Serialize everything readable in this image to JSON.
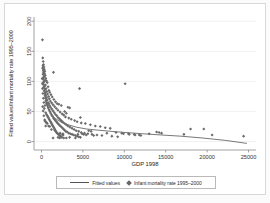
{
  "chart_data": {
    "type": "scatter",
    "title": "",
    "xlabel": "GDP 1998",
    "ylabel": "Fitted values/Infant mortality rate 1995–2000",
    "xlim": [
      -900,
      25900
    ],
    "ylim": [
      -14,
      207
    ],
    "xticks": [
      0,
      5000,
      10000,
      15000,
      20000,
      25000
    ],
    "xticklabels": [
      "0",
      "5000",
      "10000",
      "15000",
      "20000",
      "25000"
    ],
    "yticks": [
      0,
      50,
      100,
      150,
      200
    ],
    "yticklabels": [
      "0",
      "50",
      "100",
      "150",
      "200"
    ],
    "grid": true,
    "grid_axis": "y",
    "legend_position": "bottom-outside",
    "marker": "diamond",
    "marker_color": "#6b6b6b",
    "line_color": "#555555",
    "background_color": "#ffffff",
    "series": [
      {
        "name": "Infant mortality rate 1995–2000",
        "type": "scatter",
        "points": [
          [
            120,
            169
          ],
          [
            160,
            139
          ],
          [
            210,
            133
          ],
          [
            250,
            128
          ],
          [
            180,
            126
          ],
          [
            300,
            124
          ],
          [
            140,
            122
          ],
          [
            330,
            120
          ],
          [
            220,
            118
          ],
          [
            400,
            117
          ],
          [
            270,
            115
          ],
          [
            1450,
            115
          ],
          [
            370,
            113
          ],
          [
            190,
            112
          ],
          [
            460,
            110
          ],
          [
            310,
            108
          ],
          [
            240,
            106
          ],
          [
            520,
            105
          ],
          [
            150,
            104
          ],
          [
            420,
            102
          ],
          [
            600,
            101
          ],
          [
            340,
            100
          ],
          [
            280,
            99
          ],
          [
            700,
            98
          ],
          [
            10100,
            96
          ],
          [
            200,
            95
          ],
          [
            480,
            94
          ],
          [
            360,
            92
          ],
          [
            800,
            91
          ],
          [
            4600,
            88
          ],
          [
            260,
            90
          ],
          [
            560,
            88
          ],
          [
            420,
            86
          ],
          [
            900,
            85
          ],
          [
            320,
            84
          ],
          [
            640,
            83
          ],
          [
            1000,
            82
          ],
          [
            480,
            81
          ],
          [
            380,
            80
          ],
          [
            740,
            79
          ],
          [
            1150,
            78
          ],
          [
            540,
            77
          ],
          [
            430,
            76
          ],
          [
            860,
            75
          ],
          [
            1300,
            74
          ],
          [
            620,
            73
          ],
          [
            470,
            72
          ],
          [
            960,
            71
          ],
          [
            1500,
            70
          ],
          [
            700,
            69
          ],
          [
            530,
            68
          ],
          [
            1080,
            67
          ],
          [
            1700,
            66
          ],
          [
            790,
            65
          ],
          [
            590,
            64
          ],
          [
            1250,
            64
          ],
          [
            1900,
            63
          ],
          [
            880,
            63
          ],
          [
            2100,
            62
          ],
          [
            660,
            62
          ],
          [
            1400,
            61
          ],
          [
            980,
            60
          ],
          [
            2400,
            60
          ],
          [
            740,
            59
          ],
          [
            1600,
            58
          ],
          [
            1100,
            57
          ],
          [
            830,
            56
          ],
          [
            3200,
            57
          ],
          [
            1800,
            55
          ],
          [
            1250,
            54
          ],
          [
            920,
            53
          ],
          [
            3400,
            56
          ],
          [
            2000,
            52
          ],
          [
            1400,
            51
          ],
          [
            1020,
            50
          ],
          [
            2800,
            50
          ],
          [
            2250,
            49
          ],
          [
            1550,
            48
          ],
          [
            1120,
            47
          ],
          [
            3000,
            47
          ],
          [
            2500,
            46
          ],
          [
            1700,
            45
          ],
          [
            1230,
            44
          ],
          [
            620,
            45
          ],
          [
            510,
            48
          ],
          [
            2700,
            44
          ],
          [
            1850,
            43
          ],
          [
            1340,
            42
          ],
          [
            700,
            43
          ],
          [
            4700,
            40
          ],
          [
            2900,
            41
          ],
          [
            2000,
            40
          ],
          [
            1450,
            39
          ],
          [
            780,
            41
          ],
          [
            3300,
            39
          ],
          [
            2150,
            38
          ],
          [
            1560,
            37
          ],
          [
            860,
            39
          ],
          [
            3600,
            37
          ],
          [
            2300,
            36
          ],
          [
            1680,
            35
          ],
          [
            940,
            37
          ],
          [
            4000,
            35
          ],
          [
            2450,
            34
          ],
          [
            1800,
            33
          ],
          [
            1020,
            35
          ],
          [
            4300,
            33
          ],
          [
            2600,
            32
          ],
          [
            1920,
            31
          ],
          [
            1100,
            33
          ],
          [
            4800,
            31
          ],
          [
            2800,
            30
          ],
          [
            2050,
            29
          ],
          [
            1180,
            31
          ],
          [
            5300,
            30
          ],
          [
            3000,
            28
          ],
          [
            2200,
            27
          ],
          [
            1260,
            29
          ],
          [
            5900,
            28
          ],
          [
            3200,
            26
          ],
          [
            2350,
            25
          ],
          [
            1340,
            27
          ],
          [
            6500,
            26
          ],
          [
            3450,
            24
          ],
          [
            2500,
            23
          ],
          [
            1420,
            25
          ],
          [
            7100,
            25
          ],
          [
            3700,
            22
          ],
          [
            2650,
            21
          ],
          [
            1500,
            23
          ],
          [
            7700,
            23
          ],
          [
            3950,
            20
          ],
          [
            2800,
            19
          ],
          [
            1580,
            21
          ],
          [
            8300,
            22
          ],
          [
            4200,
            18
          ],
          [
            2950,
            17
          ],
          [
            1660,
            19
          ],
          [
            9000,
            15
          ],
          [
            4500,
            17
          ],
          [
            3100,
            16
          ],
          [
            1740,
            17
          ],
          [
            9700,
            14
          ],
          [
            4800,
            15
          ],
          [
            3300,
            14
          ],
          [
            1820,
            15
          ],
          [
            10500,
            13
          ],
          [
            5200,
            14
          ],
          [
            3500,
            13
          ],
          [
            1900,
            14
          ],
          [
            11200,
            12
          ],
          [
            5600,
            13
          ],
          [
            3700,
            12
          ],
          [
            1980,
            13
          ],
          [
            11800,
            11
          ],
          [
            6100,
            12
          ],
          [
            3900,
            11
          ],
          [
            2060,
            12
          ],
          [
            13900,
            16
          ],
          [
            6700,
            11
          ],
          [
            4100,
            10
          ],
          [
            2140,
            11
          ],
          [
            14200,
            15
          ],
          [
            7300,
            10
          ],
          [
            4300,
            9
          ],
          [
            2220,
            10
          ],
          [
            14500,
            14
          ],
          [
            7900,
            14
          ],
          [
            4500,
            8
          ],
          [
            2300,
            9
          ],
          [
            17200,
            12
          ],
          [
            8500,
            9
          ],
          [
            4700,
            7
          ],
          [
            2380,
            8
          ],
          [
            18000,
            21
          ],
          [
            9200,
            8
          ],
          [
            4900,
            13
          ],
          [
            2460,
            7
          ],
          [
            19600,
            21
          ],
          [
            9900,
            13
          ],
          [
            5100,
            12
          ],
          [
            2540,
            12
          ],
          [
            20600,
            11
          ],
          [
            10600,
            12
          ],
          [
            5400,
            11
          ],
          [
            2620,
            11
          ],
          [
            24400,
            9
          ],
          [
            11300,
            11
          ],
          [
            5700,
            18
          ],
          [
            2700,
            6
          ],
          [
            12000,
            10
          ],
          [
            6000,
            17
          ],
          [
            2200,
            6
          ],
          [
            13000,
            13
          ],
          [
            6300,
            10
          ],
          [
            1400,
            6
          ],
          [
            2000,
            7
          ],
          [
            3000,
            6
          ],
          [
            3400,
            7
          ],
          [
            4100,
            6
          ],
          [
            4400,
            12
          ],
          [
            700,
            30
          ],
          [
            420,
            60
          ],
          [
            350,
            55
          ],
          [
            290,
            65
          ],
          [
            230,
            72
          ],
          [
            170,
            80
          ],
          [
            130,
            88
          ],
          [
            110,
            97
          ],
          [
            95,
            105
          ],
          [
            430,
            34
          ],
          [
            560,
            32
          ],
          [
            640,
            31
          ],
          [
            390,
            36
          ],
          [
            510,
            26
          ],
          [
            860,
            26
          ],
          [
            1000,
            25
          ],
          [
            290,
            43
          ],
          [
            210,
            51
          ],
          [
            150,
            58
          ],
          [
            1200,
            20
          ],
          [
            1600,
            19
          ],
          [
            2250,
            14
          ],
          [
            2600,
            13
          ]
        ]
      },
      {
        "name": "Fitted values",
        "type": "line",
        "points": [
          [
            150,
            128
          ],
          [
            300,
            96
          ],
          [
            500,
            72
          ],
          [
            800,
            55
          ],
          [
            1200,
            45
          ],
          [
            1700,
            38
          ],
          [
            2400,
            32
          ],
          [
            3200,
            28
          ],
          [
            4200,
            24
          ],
          [
            5400,
            21
          ],
          [
            6800,
            19
          ],
          [
            8400,
            17
          ],
          [
            10200,
            15
          ],
          [
            12200,
            13
          ],
          [
            14400,
            11
          ],
          [
            16800,
            9
          ],
          [
            19400,
            6
          ],
          [
            22200,
            2
          ],
          [
            24800,
            -3
          ]
        ]
      }
    ]
  },
  "legend": {
    "entries": [
      {
        "label": "Fitted values",
        "marker": "line"
      },
      {
        "label": "Infant mortality rate 1995–2000",
        "marker": "diamond"
      }
    ]
  }
}
